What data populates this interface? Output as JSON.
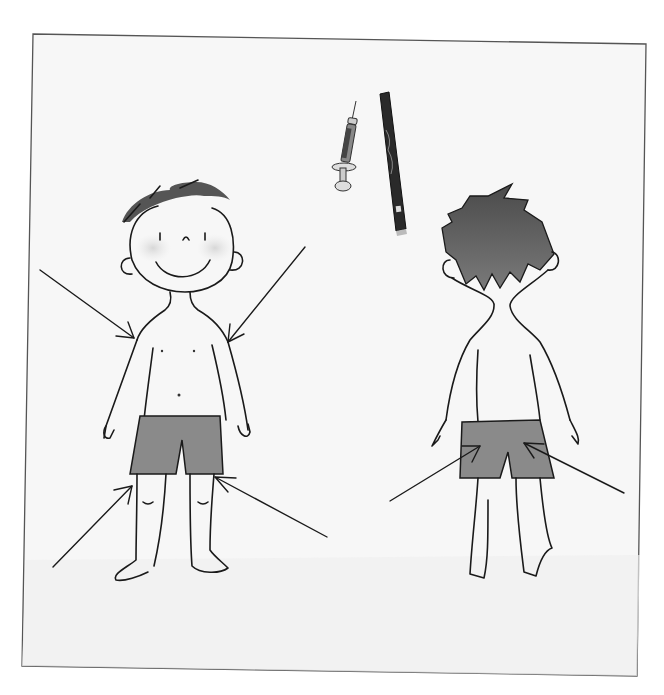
{
  "illustration": {
    "description": "Pencil drawing of a boy shown from front and back with arrows indicating injection sites; a syringe and an insulin pen are drawn at the top",
    "colors": {
      "paper": "#f7f7f7",
      "frame": "#555555",
      "ink": "#1a1a1a",
      "shorts": "#8a8a8a",
      "hair_back": "#6a6a6a",
      "pen_body": "#2a2a2a"
    },
    "figures": [
      {
        "name": "front-view-boy",
        "arrows": [
          "left-upper-arm",
          "right-upper-arm",
          "left-thigh",
          "right-thigh"
        ]
      },
      {
        "name": "back-view-boy",
        "arrows": [
          "left-buttock",
          "right-buttock"
        ]
      }
    ],
    "objects": [
      "syringe",
      "insulin-pen"
    ]
  }
}
